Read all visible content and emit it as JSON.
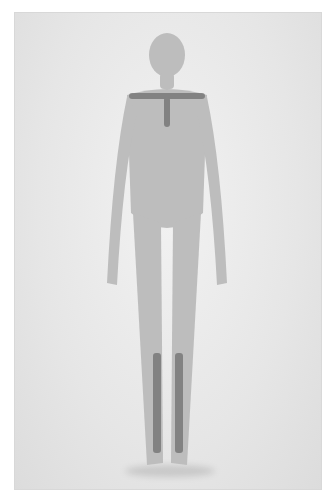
{
  "image": {
    "description": "Black-and-white studio photograph of a standing figure against a plain light backdrop",
    "palette": {
      "background": "#e9e9e9",
      "figure_tone": "#bdbdbd",
      "accent_marks": "#6f6f6f"
    }
  }
}
